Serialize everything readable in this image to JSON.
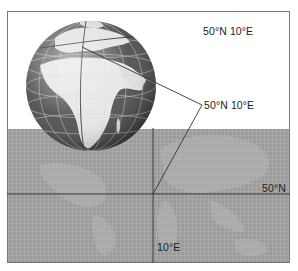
{
  "diagram": {
    "title_label": "50°N 10°E",
    "pointer_label": "50°N 10°E",
    "latitude_label": "50°N",
    "longitude_label": "10°E",
    "globe": {
      "description": "3D globe showing Europe and Africa with lat/long grid",
      "center_x": 91,
      "center_y": 86,
      "radius": 65
    },
    "flat_map": {
      "description": "Flat world map projection (gray) with 50°N parallel and 10°E meridian"
    },
    "colors": {
      "frame": "#777777",
      "map_background": "#9c9c9c",
      "land_globe": "#e6e6e6",
      "ocean_globe": "#5a5a5a",
      "lines": "#333333"
    }
  }
}
